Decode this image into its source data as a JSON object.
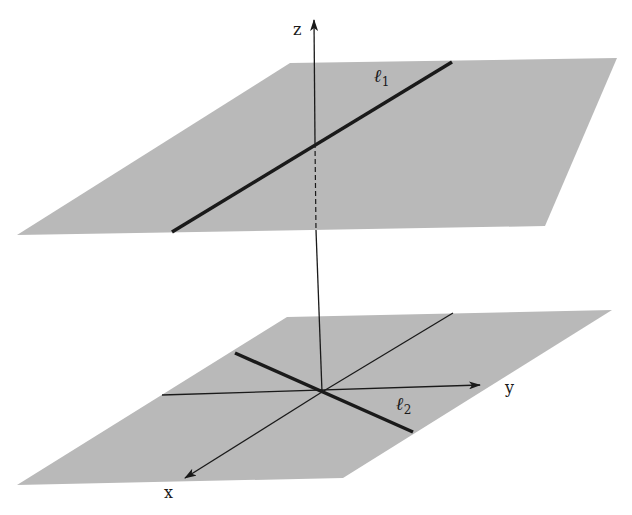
{
  "figure": {
    "colors": {
      "plane_fill": "#b9b9b9",
      "line": "#1a1a1a",
      "background": "#ffffff"
    },
    "axes": {
      "x_label": "x",
      "y_label": "y",
      "z_label": "z"
    },
    "lines": [
      {
        "name": "l1",
        "symbol": "ℓ",
        "subscript": "1",
        "plane": "upper"
      },
      {
        "name": "l2",
        "symbol": "ℓ",
        "subscript": "2",
        "plane": "lower"
      }
    ],
    "planes": [
      {
        "name": "upper-plane"
      },
      {
        "name": "lower-plane"
      }
    ]
  }
}
